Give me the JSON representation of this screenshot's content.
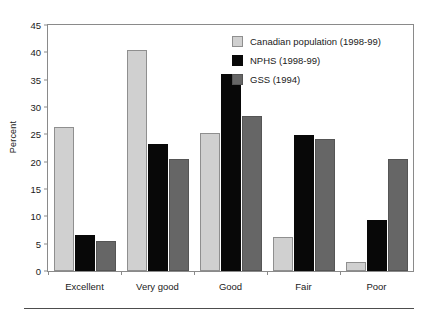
{
  "chart_data": {
    "type": "bar",
    "title": "",
    "subtitle": "",
    "xlabel": "",
    "ylabel": "Percent",
    "ylim": [
      0,
      45
    ],
    "ytick_step": 5,
    "yticks": [
      0,
      5,
      10,
      15,
      20,
      25,
      30,
      35,
      40,
      45
    ],
    "grid": false,
    "legend_position": "top-right",
    "categories": [
      "Excellent",
      "Very good",
      "Good",
      "Fair",
      "Poor"
    ],
    "series": [
      {
        "name": "Canadian population (1998-99)",
        "color": "#d0d0d0",
        "values": [
          26.4,
          40.5,
          25.2,
          6.3,
          1.6
        ]
      },
      {
        "name": "NPHS (1998-99)",
        "color": "#080808",
        "values": [
          6.6,
          23.2,
          36.1,
          24.8,
          9.3
        ]
      },
      {
        "name": "GSS (1994)",
        "color": "#666666",
        "values": [
          5.4,
          20.5,
          28.3,
          24.2,
          20.5
        ]
      }
    ]
  },
  "axis": {
    "y_title": "Percent"
  }
}
